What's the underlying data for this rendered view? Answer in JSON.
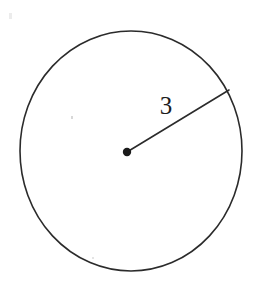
{
  "figure": {
    "kind": "circle-with-radius",
    "background_color": "#ffffff",
    "stroke_color": "#2b2b2b",
    "label_color": "#1c1c1c",
    "radius_label": "3",
    "circle": {
      "center_x": 131,
      "center_y": 151,
      "radius_x": 111,
      "radius_y": 120,
      "stroke_width": 1.6
    },
    "center_dot": {
      "x": 127,
      "y": 152,
      "r": 4.2
    },
    "radius_line": {
      "x1": 127,
      "y1": 152,
      "x2": 229,
      "y2": 90,
      "stroke_width": 1.6
    },
    "label_position": {
      "x": 166,
      "y": 114
    }
  },
  "chart_data": {
    "type": "diagram",
    "title": "",
    "shape": "circle",
    "annotations": [
      {
        "name": "radius",
        "text": "3",
        "value": 3,
        "from": "center",
        "to": "circumference"
      }
    ],
    "marks": [
      {
        "name": "center-point",
        "text": ""
      }
    ]
  }
}
